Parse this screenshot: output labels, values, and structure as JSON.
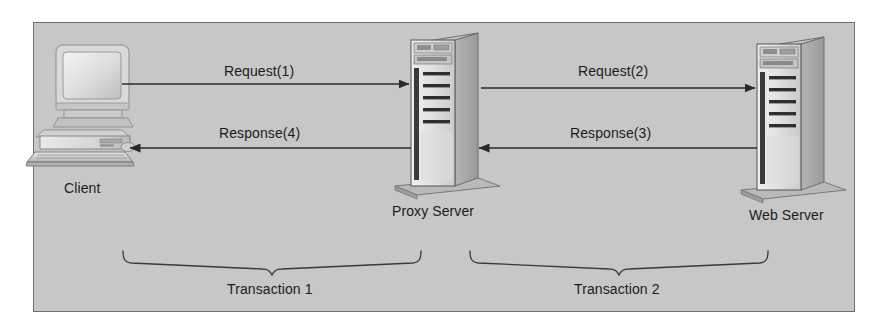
{
  "figure": {
    "panel": {
      "background_color": "#c9c9c9",
      "border_color": "#6f6f6f"
    }
  },
  "nodes": [
    {
      "id": "client",
      "label": "Client",
      "icon": "desktop-computer-icon"
    },
    {
      "id": "proxy-server",
      "label": "Proxy Server",
      "icon": "server-tower-icon"
    },
    {
      "id": "web-server",
      "label": "Web Server",
      "icon": "server-tower-icon"
    }
  ],
  "arrows": [
    {
      "id": "request-1",
      "label": "Request(1)",
      "from": "client",
      "to": "proxy-server",
      "direction": "right"
    },
    {
      "id": "request-2",
      "label": "Request(2)",
      "from": "proxy-server",
      "to": "web-server",
      "direction": "right"
    },
    {
      "id": "response-4",
      "label": "Response(4)",
      "from": "proxy-server",
      "to": "client",
      "direction": "left"
    },
    {
      "id": "response-3",
      "label": "Response(3)",
      "from": "web-server",
      "to": "proxy-server",
      "direction": "left"
    }
  ],
  "brackets": [
    {
      "id": "transaction-1",
      "label": "Transaction 1",
      "spans": "client-to-proxy-server"
    },
    {
      "id": "transaction-2",
      "label": "Transaction 2",
      "spans": "proxy-server-to-web-server"
    }
  ]
}
